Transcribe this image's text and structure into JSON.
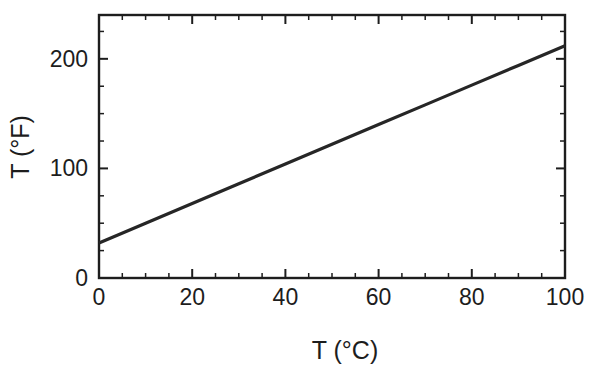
{
  "chart_data": {
    "type": "line",
    "title": "",
    "subtitle": "",
    "xlabel": "T (°C)",
    "ylabel": "T (°F)",
    "xlim": [
      0,
      100
    ],
    "ylim": [
      0,
      240
    ],
    "grid": false,
    "legend": null,
    "frame": "box",
    "tick_direction": "in",
    "x_ticks_major": [
      0,
      20,
      40,
      60,
      80,
      100
    ],
    "x_tick_labels": [
      "0",
      "20",
      "40",
      "60",
      "80",
      "100"
    ],
    "x_ticks_minor": [
      5,
      10,
      15,
      25,
      30,
      35,
      45,
      50,
      55,
      65,
      70,
      75,
      85,
      90,
      95
    ],
    "y_ticks_major": [
      0,
      100,
      200
    ],
    "y_tick_labels": [
      "0",
      "100",
      "200"
    ],
    "y_ticks_minor": [
      25,
      50,
      75,
      125,
      150,
      175,
      225
    ],
    "series": [
      {
        "name": "Celsius to Fahrenheit",
        "relation": "T(°F) = 32 + 1.8 × T(°C)",
        "x": [
          0,
          10,
          20,
          30,
          40,
          50,
          60,
          70,
          80,
          90,
          100
        ],
        "values": [
          32,
          50,
          68,
          86,
          104,
          122,
          140,
          158,
          176,
          194,
          212
        ],
        "color": "#262626",
        "linewidth": 3.2
      }
    ],
    "annotations": []
  },
  "colors": {
    "background": "#ffffff",
    "axis": "#1d1d1d",
    "line": "#262626",
    "text": "#1d1d1d"
  },
  "axis_titles": {
    "x": "T (°C)",
    "y": "T (°F)"
  },
  "tick_labels": {
    "x": [
      "0",
      "20",
      "40",
      "60",
      "80",
      "100"
    ],
    "y": [
      "0",
      "100",
      "200"
    ]
  }
}
